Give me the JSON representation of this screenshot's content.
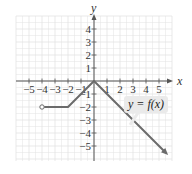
{
  "chart_data": {
    "type": "line",
    "title": "",
    "xlabel": "x",
    "ylabel": "y",
    "xlim": [
      -6,
      6
    ],
    "ylim": [
      -6,
      5
    ],
    "grid": true,
    "x_ticks": [
      -5,
      -4,
      -3,
      -2,
      -1,
      1,
      2,
      3,
      4,
      5
    ],
    "y_ticks": [
      4,
      3,
      2,
      1,
      -1,
      -2,
      -3,
      -4,
      -5
    ],
    "x_tick_labels": [
      "−5",
      "−4",
      "−3",
      "−2",
      "−1",
      "1",
      "2",
      "3",
      "4",
      "5"
    ],
    "y_tick_labels": [
      "4",
      "3",
      "2",
      "1",
      "−1",
      "−2",
      "−3",
      "−4",
      "−5"
    ],
    "series": [
      {
        "name": "y = f(x)",
        "points": [
          [
            -4,
            -2
          ],
          [
            -2,
            -2
          ],
          [
            0,
            0
          ],
          [
            5.7,
            -5.7
          ]
        ],
        "start_marker": "open-circle",
        "end_marker": "arrow",
        "color": "#6b6b6b"
      }
    ],
    "annotations": [
      {
        "text": "y = f(x)",
        "anchor": [
          4,
          -1.8
        ],
        "style": "callout-box"
      }
    ],
    "colors": {
      "grid": "#e3e3e3",
      "axis": "#555555",
      "curve": "#6b6b6b",
      "callout_bg": "#eaeaea"
    }
  }
}
